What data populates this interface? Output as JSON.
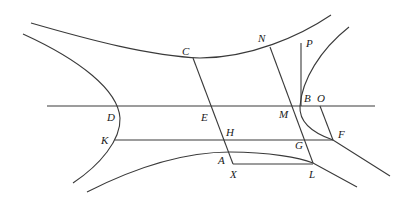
{
  "diagram": {
    "type": "conjugate-hyperbolas-construction",
    "stroke_color": "#3a3a3a",
    "background": "#ffffff",
    "labels": [
      {
        "id": "C",
        "text": "C",
        "x": 182,
        "y": 55
      },
      {
        "id": "N",
        "text": "N",
        "x": 258,
        "y": 42
      },
      {
        "id": "P",
        "text": "P",
        "x": 306,
        "y": 47
      },
      {
        "id": "D",
        "text": "D",
        "x": 107,
        "y": 121
      },
      {
        "id": "E",
        "text": "E",
        "x": 201,
        "y": 121
      },
      {
        "id": "M",
        "text": "M",
        "x": 279,
        "y": 118
      },
      {
        "id": "B",
        "text": "B",
        "x": 304,
        "y": 102
      },
      {
        "id": "O",
        "text": "O",
        "x": 317,
        "y": 102
      },
      {
        "id": "K",
        "text": "K",
        "x": 101,
        "y": 144
      },
      {
        "id": "H",
        "text": "H",
        "x": 226,
        "y": 136
      },
      {
        "id": "G",
        "text": "G",
        "x": 295,
        "y": 149
      },
      {
        "id": "F",
        "text": "F",
        "x": 338,
        "y": 138
      },
      {
        "id": "A",
        "text": "A",
        "x": 218,
        "y": 164
      },
      {
        "id": "X",
        "text": "X",
        "x": 230,
        "y": 178
      },
      {
        "id": "L",
        "text": "L",
        "x": 309,
        "y": 178
      }
    ],
    "curves": [
      {
        "name": "upper-branch",
        "d": "M31,23 C90,40 150,56 200,58 C250,58 300,36 331,15"
      },
      {
        "name": "left-branch",
        "d": "M23,34 C80,60 118,90 120,118 C121,140 100,165 73,183"
      },
      {
        "name": "right-branch",
        "d": "M349,27 C320,50 302,80 300,106 C299,120 310,132 333,140 L390,176"
      },
      {
        "name": "lower-branch",
        "d": "M87,192 C140,165 190,152 230,152 C270,152 300,158 313,163 L357,187"
      }
    ],
    "lines": [
      {
        "name": "line-DB",
        "x1": 47,
        "y1": 106,
        "x2": 375,
        "y2": 106
      },
      {
        "name": "line-KF",
        "x1": 115,
        "y1": 140,
        "x2": 333,
        "y2": 140
      },
      {
        "name": "line-XL",
        "x1": 233,
        "y1": 164,
        "x2": 313,
        "y2": 164
      },
      {
        "name": "line-CX",
        "x1": 193,
        "y1": 58,
        "x2": 233,
        "y2": 164
      },
      {
        "name": "line-NL",
        "x1": 270,
        "y1": 47,
        "x2": 313,
        "y2": 163
      },
      {
        "name": "line-PB",
        "x1": 301,
        "y1": 43,
        "x2": 301,
        "y2": 106
      },
      {
        "name": "line-OF",
        "x1": 320,
        "y1": 106,
        "x2": 333,
        "y2": 140
      }
    ]
  }
}
